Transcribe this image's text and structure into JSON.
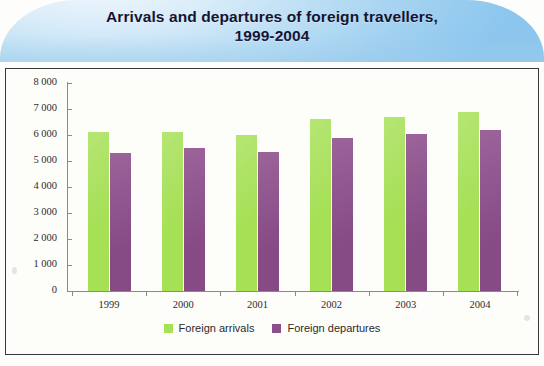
{
  "header": {
    "title_line1": "Arrivals and departures of foreign travellers,",
    "title_line2": "1999-2004"
  },
  "colors": {
    "arrivals": "#a5e055",
    "departures": "#8d4e8c",
    "banner_blue": "#9ecff0",
    "frame_border": "#3a3a3a",
    "axis": "#8a8a8a"
  },
  "chart_data": {
    "type": "bar",
    "title": "Arrivals and departures of foreign travellers, 1999-2004",
    "xlabel": "",
    "ylabel": "",
    "categories": [
      "1999",
      "2000",
      "2001",
      "2002",
      "2003",
      "2004"
    ],
    "series": [
      {
        "name": "Foreign arrivals",
        "color": "#a5e055",
        "values": [
          6100,
          6100,
          6000,
          6600,
          6700,
          6900
        ]
      },
      {
        "name": "Foreign departures",
        "color": "#8d4e8c",
        "values": [
          5300,
          5500,
          5350,
          5900,
          6050,
          6200
        ]
      }
    ],
    "ylim": [
      0,
      8000
    ],
    "ytick_step": 1000,
    "ytick_labels": [
      "0",
      "1 000",
      "2 000",
      "3 000",
      "4 000",
      "5 000",
      "6 000",
      "7 000",
      "8 000"
    ],
    "ytick_values": [
      0,
      1000,
      2000,
      3000,
      4000,
      5000,
      6000,
      7000,
      8000
    ],
    "grid": false,
    "legend_position": "bottom"
  }
}
